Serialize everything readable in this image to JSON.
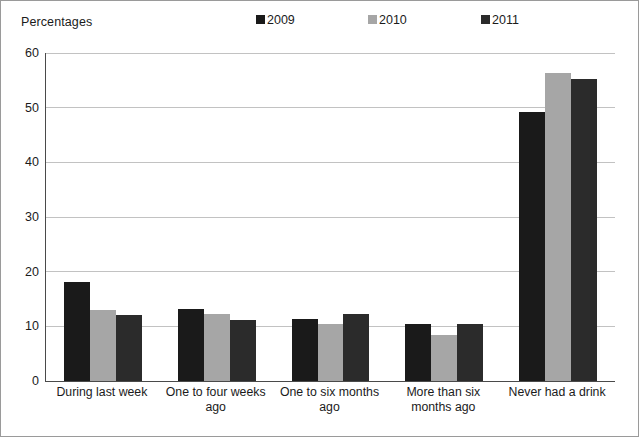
{
  "axis_title": "Percentages",
  "legend": {
    "position": "top",
    "entries": [
      {
        "label": "2009",
        "color": "#1a1a1a",
        "icon": "square-swatch-icon"
      },
      {
        "label": "2010",
        "color": "#a6a6a6",
        "icon": "square-swatch-icon"
      },
      {
        "label": "2011",
        "color": "#2b2b2b",
        "icon": "square-swatch-icon"
      }
    ]
  },
  "chart_data": {
    "type": "bar",
    "title": "",
    "subtitle": "",
    "xlabel": "",
    "ylabel": "Percentages",
    "ylim": [
      0,
      60
    ],
    "yticks": [
      0,
      10,
      20,
      30,
      40,
      50,
      60
    ],
    "ytick_labels": [
      "0",
      "10",
      "20",
      "30",
      "40",
      "50",
      "60"
    ],
    "grid": true,
    "legend_position": "top",
    "categories": [
      "During last week",
      "One to four weeks ago",
      "One to six months ago",
      "More than six months ago",
      "Never had a drink"
    ],
    "series": [
      {
        "name": "2009",
        "color": "#1a1a1a",
        "values": [
          18.1,
          13.2,
          11.3,
          10.4,
          49.3
        ]
      },
      {
        "name": "2010",
        "color": "#a6a6a6",
        "values": [
          13.0,
          12.2,
          10.4,
          8.5,
          56.3
        ]
      },
      {
        "name": "2011",
        "color": "#2b2b2b",
        "values": [
          12.0,
          11.1,
          12.3,
          10.4,
          55.3
        ]
      }
    ]
  }
}
